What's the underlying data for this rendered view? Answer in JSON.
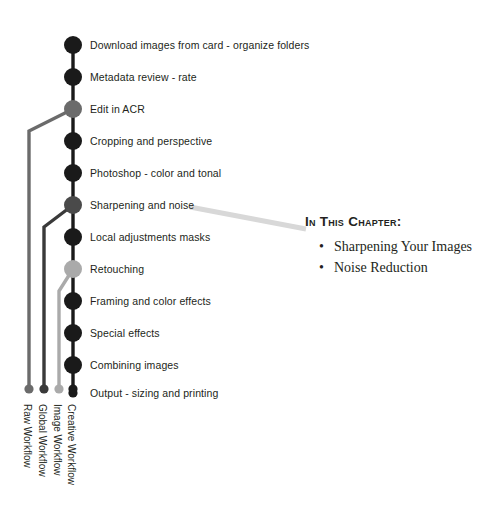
{
  "diagram": {
    "spine": {
      "x": 73,
      "top_y": 45,
      "bottom_y": 393,
      "step_gap": 32,
      "color": "#1a1a1a",
      "width": 3.4,
      "node_radius": 9,
      "terminal_radius": 4.6
    },
    "steps": [
      {
        "label": "Download images from card - organize folders",
        "y": 45,
        "node_color": "#1a1a1a"
      },
      {
        "label": "Metadata review - rate",
        "y": 77,
        "node_color": "#1a1a1a"
      },
      {
        "label": "Edit in ACR",
        "y": 109,
        "node_color": "#6b6b6b"
      },
      {
        "label": "Cropping and perspective",
        "y": 141,
        "node_color": "#1a1a1a"
      },
      {
        "label": "Photoshop - color and tonal",
        "y": 173,
        "node_color": "#1a1a1a"
      },
      {
        "label": "Sharpening and noise",
        "y": 205,
        "node_color": "#4a4a4a"
      },
      {
        "label": "Local adjustments masks",
        "y": 237,
        "node_color": "#1a1a1a"
      },
      {
        "label": "Retouching",
        "y": 269,
        "node_color": "#aaaaaa"
      },
      {
        "label": "Framing and color effects",
        "y": 301,
        "node_color": "#1a1a1a"
      },
      {
        "label": "Special effects",
        "y": 333,
        "node_color": "#1a1a1a"
      },
      {
        "label": "Combining images",
        "y": 365,
        "node_color": "#1a1a1a"
      },
      {
        "label": "Output - sizing and printing",
        "y": 393,
        "node_color": "#1a1a1a"
      }
    ],
    "label_x": 90,
    "branches": [
      {
        "name": "raw-workflow",
        "label": "Raw Workflow",
        "color": "#6b6b6b",
        "from_y": 109,
        "x": 29,
        "bend_y": 131,
        "end_y": 389
      },
      {
        "name": "global-workflow",
        "label": "Global Workflow",
        "color": "#3a3a3a",
        "from_y": 205,
        "x": 44,
        "bend_y": 227,
        "end_y": 389
      },
      {
        "name": "image-workflow",
        "label": "Image Workflow",
        "color": "#aaaaaa",
        "from_y": 269,
        "x": 59,
        "bend_y": 291,
        "end_y": 389
      },
      {
        "name": "creative-workflow",
        "label": "Creative Workflow",
        "color": "#1a1a1a",
        "from_y": 393,
        "x": 73,
        "bend_y": 393,
        "end_y": 389
      }
    ],
    "track_label_y": 404,
    "connector": {
      "color": "#d8d8d8",
      "width": 5,
      "x1": 190,
      "y1": 207,
      "x2": 306,
      "y2": 229
    }
  },
  "chapter": {
    "heading": "In This Chapter:",
    "bullet_glyph": "•",
    "items": [
      "Sharpening Your Images",
      "Noise Reduction"
    ]
  }
}
